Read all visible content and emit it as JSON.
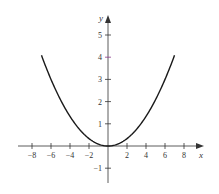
{
  "chart_data": {
    "type": "line",
    "title": "",
    "xlabel": "x",
    "ylabel": "y",
    "function": "y = x^2/12",
    "xlim": [
      -9.5,
      9.5
    ],
    "ylim": [
      -1.7,
      6
    ],
    "grid": false,
    "x_ticks": [
      -8,
      -6,
      -4,
      -2,
      2,
      4,
      6,
      8
    ],
    "x_tick_labels": [
      "−8",
      "−6",
      "−4",
      "−2",
      "2",
      "4",
      "6",
      "8"
    ],
    "y_ticks": [
      5,
      4,
      3,
      2,
      1,
      -1
    ],
    "y_tick_labels": [
      "5",
      "4",
      "3",
      "2",
      "1",
      "−1"
    ],
    "series": [
      {
        "name": "parabola",
        "x": [
          -7,
          -6,
          -5,
          -4,
          -3,
          -2,
          -1,
          0,
          1,
          2,
          3,
          4,
          5,
          6,
          7
        ],
        "y": [
          4.08,
          3.0,
          2.08,
          1.33,
          0.75,
          0.33,
          0.08,
          0,
          0.08,
          0.33,
          0.75,
          1.33,
          2.08,
          3.0,
          4.08
        ]
      }
    ],
    "colors": {
      "curve": "#1a1a1a",
      "axes": "#333333",
      "highlight_tick": "#8a3a8a"
    }
  }
}
